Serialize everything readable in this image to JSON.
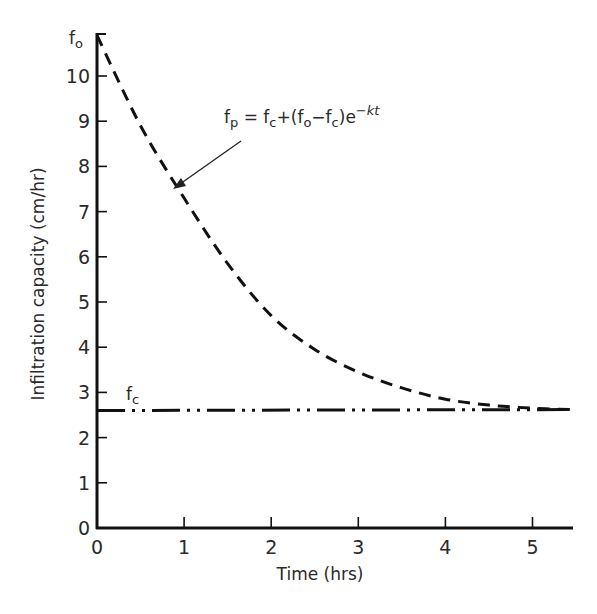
{
  "chart_data": {
    "type": "line",
    "title": "",
    "xlabel": "Time (hrs)",
    "ylabel": "Infiltration capacity (cm/hr)",
    "xlim": [
      0,
      5.45
    ],
    "ylim": [
      0,
      11
    ],
    "grid": false,
    "legend": "none",
    "x_ticks": [
      "0",
      "1",
      "2",
      "3",
      "4",
      "5"
    ],
    "y_ticks": [
      "0",
      "1",
      "2",
      "3",
      "4",
      "5",
      "6",
      "7",
      "8",
      "9",
      "10"
    ],
    "y_top_tick_label": "fo",
    "series": [
      {
        "name": "fp",
        "style": "dashed",
        "x": [
          0,
          0.5,
          1,
          1.5,
          2,
          2.5,
          3,
          3.5,
          4,
          4.5,
          5,
          5.45
        ],
        "values": [
          10.9,
          8.9,
          7.3,
          5.85,
          4.7,
          3.95,
          3.45,
          3.1,
          2.85,
          2.72,
          2.65,
          2.62
        ]
      },
      {
        "name": "fc",
        "style": "dash-dot-dot",
        "x": [
          0,
          5.45
        ],
        "values": [
          2.6,
          2.62
        ]
      }
    ],
    "annotations": [
      {
        "text": "fp = fc+(fo−fc)e^(−kt)",
        "points_to": {
          "x": 0.9,
          "y": 7.5
        }
      },
      {
        "text": "fc",
        "at": {
          "x": 0.2,
          "y": 2.9
        }
      },
      {
        "text": "fo",
        "at": {
          "x": -0.2,
          "y": 10.9
        }
      }
    ],
    "fo_value": 10.9,
    "fc_value": 2.6
  },
  "labels": {
    "xlabel": "Time (hrs)",
    "ylabel": "Infiltration capacity (cm/hr)",
    "fo_tick": {
      "base": "f",
      "sub": "o"
    },
    "fc_label": {
      "base": "f",
      "sub": "c"
    },
    "equation": {
      "lhs_base": "f",
      "lhs_sub": "p",
      "eq": " = ",
      "t1_base": "f",
      "t1_sub": "c",
      "plus": "+(",
      "t2_base": "f",
      "t2_sub": "o",
      "minus": "−",
      "t3_base": "f",
      "t3_sub": "c",
      "close": ")e",
      "exp_sign": "−",
      "exp_var": "kt"
    }
  }
}
